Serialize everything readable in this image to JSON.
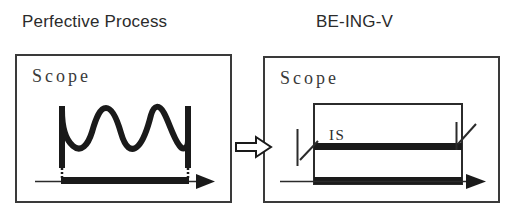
{
  "figure": {
    "type": "diagram",
    "background_color": "#ffffff",
    "ink_color": "#1a1a1a",
    "border_color": "#3a3a3a"
  },
  "panels": {
    "left": {
      "title": "Perfective Process",
      "scope_label": "Scope",
      "timeline_label": "",
      "description": "zigzag wave bounded by two vertical bars with dotted drop lines to a bold timeline segment"
    },
    "right": {
      "title": "BE-ING-V",
      "scope_label": "Scope",
      "inner_label": "IS",
      "description": "open rectangle containing a bold horizontal bar, a second bold bar on the timeline, and two diagonal leader lines with vertical ticks"
    }
  },
  "connector": {
    "name": "block-arrow",
    "direction": "right"
  },
  "caption": {
    "text": ""
  }
}
